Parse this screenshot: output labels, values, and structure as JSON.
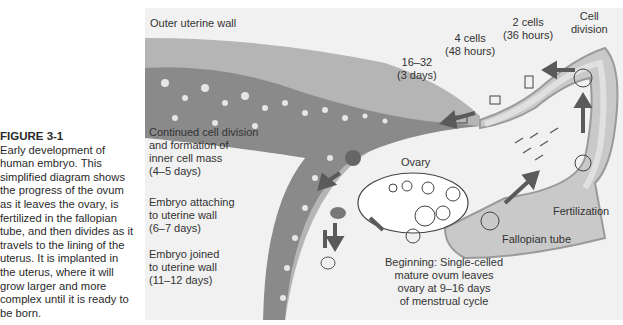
{
  "caption": {
    "title": "FIGURE 3-1",
    "lines": [
      "Early development of",
      "human embryo. This",
      "simplified diagram shows",
      "the progress of the ovum",
      "as it leaves the ovary, is",
      "fertilized in the fallopian",
      "tube, and then divides as it",
      "travels to the lining of the",
      "uterus. It is implanted in",
      "the uterus, where it will",
      "grow larger and more",
      "complex until it is ready to",
      "be born."
    ]
  },
  "labels": {
    "outer_wall": "Outer uterine wall",
    "cell_division": [
      "Cell",
      "division"
    ],
    "two_cells": [
      "2 cells",
      "(36 hours)"
    ],
    "four_cells": [
      "4 cells",
      "(48 hours)"
    ],
    "sixteen_cells": [
      "16–32",
      "(3 days)"
    ],
    "inner_mass": [
      "Continued cell division",
      "and formation of",
      "inner cell mass",
      "(4–5 days)"
    ],
    "attaching": [
      "Embryo attaching",
      "to uterine wall",
      "(6–7 days)"
    ],
    "joined": [
      "Embryo joined",
      "to uterine wall",
      "(11–12 days)"
    ],
    "ovary": "Ovary",
    "fertilization": "Fertilization",
    "fallopian_tube": "Fallopian tube",
    "beginning": [
      "Beginning: Single-celled",
      "mature ovum leaves",
      "ovary at 9–16 days",
      "of menstrual cycle"
    ]
  },
  "colors": {
    "background": "#f1f1f1",
    "wall_light": "#b5b5b5",
    "wall_dark": "#8a8a8a",
    "tube": "#c9c9c9",
    "arrow": "#5a5a5a"
  }
}
